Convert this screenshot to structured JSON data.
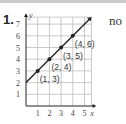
{
  "problem": {
    "number": "1.",
    "answer": "no"
  },
  "chart_data": {
    "type": "line",
    "title": "",
    "xlabel": "x",
    "ylabel": "y",
    "xlim": [
      0,
      5
    ],
    "ylim": [
      0,
      7
    ],
    "x_ticks": [
      "1",
      "2",
      "3",
      "4",
      "5"
    ],
    "y_ticks": [
      "1",
      "2",
      "3",
      "4",
      "5",
      "6",
      "7"
    ],
    "grid": true,
    "series": [
      {
        "name": "line",
        "x": [
          0,
          1,
          2,
          3,
          4,
          5
        ],
        "y": [
          2,
          3,
          4,
          5,
          6,
          7
        ]
      }
    ],
    "points": [
      {
        "x": 1,
        "y": 3,
        "label": "(1, 3)"
      },
      {
        "x": 2,
        "y": 4,
        "label": "(2, 4)"
      },
      {
        "x": 3,
        "y": 5,
        "label": "(3, 5)"
      },
      {
        "x": 4,
        "y": 6,
        "label": "(4, 6)"
      }
    ],
    "colors": {
      "line": "#222222",
      "grid": "#bdbdbd"
    }
  }
}
